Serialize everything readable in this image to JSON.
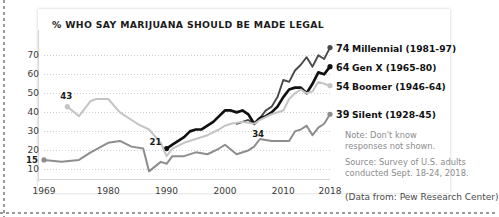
{
  "chart_data": {
    "type": "line",
    "title": "% WHO SAY MARIJUANA SHOULD BE MADE LEGAL",
    "xlabel": "",
    "ylabel": "",
    "xlim": [
      1969,
      2018
    ],
    "ylim": [
      5,
      78
    ],
    "grid": true,
    "legend_position": "right",
    "xticks": [
      "1969",
      "1980",
      "1990",
      "2000",
      "2010",
      "2018"
    ],
    "xtick_values": [
      1969,
      1980,
      1990,
      2000,
      2010,
      2018
    ],
    "yticks": [
      "10",
      "20",
      "30",
      "40",
      "50",
      "60",
      "70"
    ],
    "ytick_values": [
      10,
      20,
      30,
      40,
      50,
      60,
      70
    ],
    "series": [
      {
        "name": "Millennial (1981-97)",
        "color": "#4a4a4a",
        "end_value": 74,
        "x": [
          2002,
          2003,
          2004,
          2005,
          2006,
          2007,
          2008,
          2009,
          2010,
          2011,
          2012,
          2013,
          2014,
          2015,
          2016,
          2017,
          2018
        ],
        "values": [
          34,
          35,
          36,
          34,
          37,
          41,
          43,
          48,
          57,
          56,
          62,
          65,
          69,
          64,
          70,
          68,
          74
        ]
      },
      {
        "name": "Gen X (1965-80)",
        "color": "#111111",
        "end_value": 64,
        "start_value": 21,
        "x": [
          1990,
          1991,
          1992,
          1993,
          1994,
          1995,
          1996,
          1997,
          1998,
          1999,
          2000,
          2001,
          2002,
          2003,
          2004,
          2005,
          2006,
          2007,
          2008,
          2009,
          2010,
          2011,
          2012,
          2013,
          2014,
          2015,
          2016,
          2017,
          2018
        ],
        "values": [
          21,
          23,
          25,
          27,
          30,
          31,
          31,
          33,
          35,
          38,
          41,
          41,
          40,
          41,
          39,
          34,
          37,
          38,
          40,
          43,
          48,
          52,
          53,
          53,
          50,
          55,
          61,
          60,
          64
        ]
      },
      {
        "name": "Boomer (1946-64)",
        "color": "#c4c4c4",
        "end_value": 54,
        "start_value": 43,
        "x": [
          1973,
          1975,
          1977,
          1978,
          1980,
          1982,
          1985,
          1987,
          1989,
          1990,
          1991,
          1993,
          1995,
          1997,
          1999,
          2000,
          2001,
          2003,
          2005,
          2006,
          2008,
          2010,
          2011,
          2012,
          2013,
          2014,
          2015,
          2016,
          2017,
          2018
        ],
        "values": [
          43,
          38,
          46,
          47,
          47,
          40,
          34,
          31,
          24,
          17,
          21,
          24,
          26,
          28,
          31,
          33,
          34,
          35,
          34,
          36,
          39,
          41,
          47,
          50,
          52,
          50,
          51,
          56,
          55,
          54
        ]
      },
      {
        "name": "Silent (1928-45)",
        "color": "#8d8d8d",
        "end_value": 39,
        "start_value": 15,
        "x": [
          1969,
          1972,
          1975,
          1977,
          1980,
          1982,
          1984,
          1986,
          1987,
          1989,
          1990,
          1991,
          1993,
          1995,
          1997,
          1999,
          2000,
          2002,
          2004,
          2005,
          2006,
          2008,
          2010,
          2011,
          2012,
          2013,
          2014,
          2015,
          2016,
          2017,
          2018
        ],
        "values": [
          15,
          14,
          15,
          19,
          24,
          25,
          22,
          21,
          9,
          14,
          13,
          17,
          17,
          19,
          18,
          21,
          23,
          18,
          20,
          22,
          26,
          25,
          25,
          25,
          30,
          31,
          33,
          28,
          32,
          34,
          39
        ]
      }
    ],
    "annotations": [
      {
        "label": "43",
        "x": 1973,
        "y": 43
      },
      {
        "label": "15",
        "x": 1969,
        "y": 15
      },
      {
        "label": "21",
        "x": 1990,
        "y": 21
      },
      {
        "label": "34",
        "x": 2005,
        "y": 34
      }
    ]
  },
  "legend": [
    {
      "value": "74",
      "name": "Millennial (1981-97)"
    },
    {
      "value": "64",
      "name": "Gen X (1965-80)"
    },
    {
      "value": "54",
      "name": "Boomer (1946-64)"
    },
    {
      "value": "39",
      "name": "Silent (1928-45)"
    }
  ],
  "note": "Note: Don't know\nresponses not shown.",
  "source": "Source: Survey of U.S. adults\nconducted Sept. 18-24, 2018.",
  "credit": "(Data from: Pew Research Center)"
}
